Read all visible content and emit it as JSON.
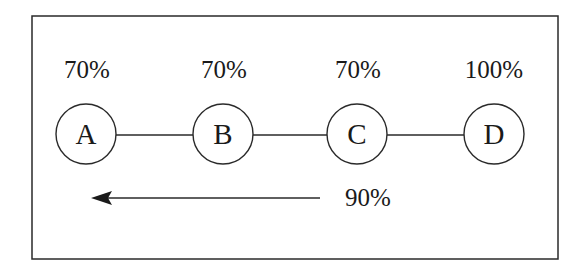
{
  "diagram": {
    "frame": {
      "stroke": "#2a2a2a"
    },
    "nodes": [
      {
        "id": "A",
        "label": "A",
        "percent": "70%"
      },
      {
        "id": "B",
        "label": "B",
        "percent": "70%"
      },
      {
        "id": "C",
        "label": "C",
        "percent": "70%"
      },
      {
        "id": "D",
        "label": "D",
        "percent": "100%"
      }
    ],
    "edges": [
      {
        "from": "A",
        "to": "B"
      },
      {
        "from": "B",
        "to": "C"
      },
      {
        "from": "C",
        "to": "D"
      }
    ],
    "arrow": {
      "direction": "left",
      "label": "90%"
    }
  }
}
